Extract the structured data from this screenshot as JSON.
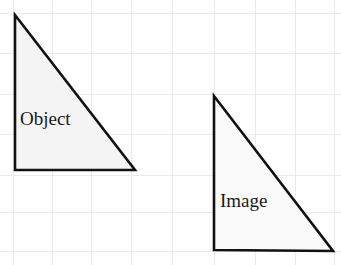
{
  "canvas": {
    "width": 341,
    "height": 265,
    "background_color": "#ffffff",
    "title": "Object and Image triangles on grid paper"
  },
  "grid": {
    "visible": true,
    "line_color": "#ebebeb",
    "spacing_px": 40,
    "vertical_x": [
      13,
      52,
      91,
      131,
      172,
      214,
      255,
      295,
      334
    ],
    "horizontal_y": [
      13,
      53,
      94,
      134,
      175,
      212,
      251
    ]
  },
  "shapes": [
    {
      "name": "object-triangle",
      "label": "Object",
      "type": "right-triangle",
      "outline_color": "#111111",
      "fill_color": "#f4f4f4",
      "stroke_width": 2.6,
      "points": "15,15 15,170 135,170",
      "vertices": [
        {
          "x": 15,
          "y": 15
        },
        {
          "x": 15,
          "y": 170
        },
        {
          "x": 135,
          "y": 170
        }
      ],
      "label_x": 20,
      "label_y": 125,
      "leg_vertical_px": 155,
      "leg_horizontal_px": 120
    },
    {
      "name": "image-triangle",
      "label": "Image",
      "type": "right-triangle",
      "outline_color": "#111111",
      "fill_color": "#fafafa",
      "stroke_width": 2.6,
      "points": "214,96 214,250 333,251",
      "vertices": [
        {
          "x": 214,
          "y": 96
        },
        {
          "x": 214,
          "y": 250
        },
        {
          "x": 333,
          "y": 251
        }
      ],
      "label_x": 220,
      "label_y": 207,
      "leg_vertical_px": 154,
      "leg_horizontal_px": 119
    }
  ]
}
